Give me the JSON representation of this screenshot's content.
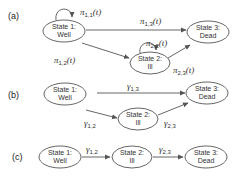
{
  "panels": [
    {
      "label": "(a)",
      "states": [
        {
          "line1": "State 1:",
          "line2": "Well"
        },
        {
          "line1": "State 2:",
          "line2": "Ill"
        },
        {
          "line1": "State 3:",
          "line2": "Dead"
        }
      ],
      "edges": [
        {
          "from": "State 1",
          "to": "State 1",
          "sym": "π",
          "sub": "1,1",
          "arg": "(t)"
        },
        {
          "from": "State 1",
          "to": "State 3",
          "sym": "π",
          "sub": "1,3",
          "arg": "(t)"
        },
        {
          "from": "State 1",
          "to": "State 2",
          "sym": "π",
          "sub": "1,2",
          "arg": "(t)"
        },
        {
          "from": "State 2",
          "to": "State 2",
          "sym": "π",
          "sub": "2,2",
          "arg": "(t)"
        },
        {
          "from": "State 2",
          "to": "State 3",
          "sym": "π",
          "sub": "2,3",
          "arg": "(t)"
        }
      ]
    },
    {
      "label": "(b)",
      "states": [
        {
          "line1": "State 1:",
          "line2": "Well"
        },
        {
          "line1": "State 2:",
          "line2": "Ill"
        },
        {
          "line1": "State 3:",
          "line2": "Dead"
        }
      ],
      "edges": [
        {
          "from": "State 1",
          "to": "State 3",
          "sym": "γ",
          "sub": "1,3",
          "arg": ""
        },
        {
          "from": "State 1",
          "to": "State 2",
          "sym": "γ",
          "sub": "1,2",
          "arg": ""
        },
        {
          "from": "State 2",
          "to": "State 3",
          "sym": "γ",
          "sub": "2,3",
          "arg": ""
        }
      ]
    },
    {
      "label": "(c)",
      "states": [
        {
          "line1": "State 1:",
          "line2": "Well"
        },
        {
          "line1": "State 2:",
          "line2": "Ill"
        },
        {
          "line1": "State 3:",
          "line2": "Dead"
        }
      ],
      "edges": [
        {
          "from": "State 1",
          "to": "State 2",
          "sym": "γ",
          "sub": "1,2",
          "arg": ""
        },
        {
          "from": "State 2",
          "to": "State 3",
          "sym": "γ",
          "sub": "2,3",
          "arg": ""
        }
      ]
    }
  ]
}
